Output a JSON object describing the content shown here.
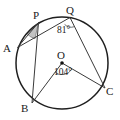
{
  "figure": {
    "kind": "circle-geometry-diagram",
    "background_color": "#ffffff",
    "stroke_color": "#3a3a3a",
    "circle_stroke_color": "#1f1f1f",
    "shade_color": "#b5b5b5",
    "circle": {
      "center_label": "O",
      "cx": 62,
      "cy": 63,
      "r": 46
    },
    "points": [
      {
        "label": "A",
        "x": 17.5,
        "y": 47.5,
        "label_x": 3,
        "label_y": 43
      },
      {
        "label": "P",
        "x": 38.5,
        "y": 22.5,
        "label_x": 33,
        "label_y": 10
      },
      {
        "label": "Q",
        "x": 70.0,
        "y": 17.5,
        "label_x": 66,
        "label_y": 5
      },
      {
        "label": "B",
        "x": 32.0,
        "y": 103.0,
        "label_x": 21,
        "label_y": 103
      },
      {
        "label": "C",
        "x": 105.0,
        "y": 88.0,
        "label_x": 106,
        "label_y": 86
      },
      {
        "label": "O",
        "x": 62.0,
        "y": 63.0,
        "label_x": 57,
        "label_y": 50
      }
    ],
    "chords": [
      {
        "name": "chord-A-P",
        "from": "A",
        "to": "P"
      },
      {
        "name": "chord-A-Q",
        "from": "A",
        "to": "Q"
      },
      {
        "name": "chord-P-B",
        "from": "P",
        "to": "B"
      },
      {
        "name": "chord-Q-C",
        "from": "Q",
        "to": "C"
      },
      {
        "name": "radius-O-B",
        "from": "O",
        "to": "B"
      },
      {
        "name": "radius-O-C",
        "from": "O",
        "to": "C"
      }
    ],
    "angles": [
      {
        "name": "angle-at-Q",
        "vertex": "Q",
        "value": "81",
        "degree_symbol": "°",
        "text": "81°",
        "label_x": 57,
        "label_y": 26,
        "arc_marked": true,
        "shaded": false
      },
      {
        "name": "angle-at-O",
        "vertex": "O",
        "value": "104",
        "degree_symbol": "°",
        "text": "104°",
        "label_x": 54,
        "label_y": 68,
        "arc_marked": true,
        "shaded": false
      },
      {
        "name": "angle-at-P",
        "vertex": "P",
        "value": "",
        "degree_symbol": "",
        "text": "",
        "arc_marked": false,
        "shaded": true
      }
    ],
    "center_dot": {
      "name": "center-point-dot",
      "x": 62,
      "y": 63,
      "r": 1.8
    }
  }
}
